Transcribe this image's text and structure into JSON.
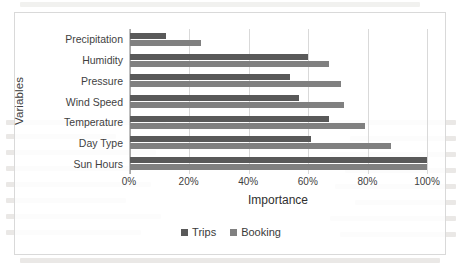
{
  "chart_data": {
    "type": "bar",
    "orientation": "horizontal",
    "title": "",
    "xlabel": "Importance",
    "ylabel": "Variables",
    "xlim": [
      0,
      100
    ],
    "xtick_labels": [
      "0%",
      "20%",
      "40%",
      "60%",
      "80%",
      "100%"
    ],
    "xtick_values": [
      0,
      20,
      40,
      60,
      80,
      100
    ],
    "grid": true,
    "legend_position": "bottom",
    "categories": [
      "Precipitation",
      "Humidity",
      "Pressure",
      "Wind Speed",
      "Temperature",
      "Day Type",
      "Sun Hours"
    ],
    "series": [
      {
        "name": "Trips",
        "color": "#595959",
        "values": [
          12,
          60,
          54,
          57,
          67,
          61,
          100
        ]
      },
      {
        "name": "Booking",
        "color": "#808080",
        "values": [
          24,
          67,
          71,
          72,
          79,
          88,
          100
        ]
      }
    ]
  },
  "legend": {
    "items": [
      {
        "label": "Trips",
        "color": "#595959"
      },
      {
        "label": "Booking",
        "color": "#808080"
      }
    ]
  }
}
